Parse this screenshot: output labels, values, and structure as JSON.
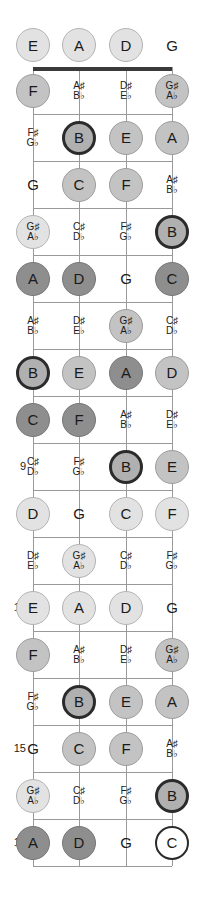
{
  "diagram": {
    "tuning": [
      "E",
      "A",
      "D",
      "G"
    ],
    "string_count": 4,
    "fret_count": 17,
    "fret_markers": [
      "5",
      "7",
      "9",
      "12",
      "15",
      "17"
    ],
    "colors": {
      "nut": "#3a3a3a",
      "fret_line": "#999999",
      "string": "#9a9a9a",
      "text": "#1a1a1a",
      "root_fill": "#ffffff",
      "root_border": "#2b2b2b",
      "accent_dark": "#5a5a5a",
      "accent_light": "#dcdcdc"
    },
    "geometry": {
      "left": 33,
      "right": 172,
      "nut_y": 67,
      "fret_spacing": 47,
      "string_x": [
        33,
        79,
        126,
        172
      ]
    }
  },
  "rows": [
    {
      "fret": "0",
      "marker": "",
      "notes": [
        {
          "name": "E",
          "alt": "",
          "style": "light",
          "shape": "circle"
        },
        {
          "name": "A",
          "alt": "",
          "style": "light",
          "shape": "circle"
        },
        {
          "name": "D",
          "alt": "",
          "style": "light",
          "shape": "circle"
        },
        {
          "name": "G",
          "alt": "",
          "style": "none",
          "shape": "plain"
        }
      ]
    },
    {
      "fret": "1",
      "marker": "",
      "notes": [
        {
          "name": "F",
          "alt": "",
          "style": "mid",
          "shape": "circle"
        },
        {
          "name": "A♯",
          "alt": "B♭",
          "style": "none",
          "shape": "plain"
        },
        {
          "name": "D♯",
          "alt": "E♭",
          "style": "none",
          "shape": "plain"
        },
        {
          "name": "G♯",
          "alt": "A♭",
          "style": "mid",
          "shape": "circle"
        }
      ]
    },
    {
      "fret": "2",
      "marker": "",
      "notes": [
        {
          "name": "F♯",
          "alt": "G♭",
          "style": "none",
          "shape": "plain"
        },
        {
          "name": "B",
          "alt": "",
          "style": "ring",
          "shape": "circle"
        },
        {
          "name": "E",
          "alt": "",
          "style": "mid",
          "shape": "circle"
        },
        {
          "name": "A",
          "alt": "",
          "style": "mid",
          "shape": "circle"
        }
      ]
    },
    {
      "fret": "3",
      "marker": "",
      "notes": [
        {
          "name": "G",
          "alt": "",
          "style": "none",
          "shape": "plain"
        },
        {
          "name": "C",
          "alt": "",
          "style": "mid",
          "shape": "circle"
        },
        {
          "name": "F",
          "alt": "",
          "style": "mid",
          "shape": "circle"
        },
        {
          "name": "A♯",
          "alt": "B♭",
          "style": "none",
          "shape": "plain"
        }
      ]
    },
    {
      "fret": "4",
      "marker": "",
      "notes": [
        {
          "name": "G♯",
          "alt": "A♭",
          "style": "light",
          "shape": "circle"
        },
        {
          "name": "C♯",
          "alt": "D♭",
          "style": "none",
          "shape": "plain"
        },
        {
          "name": "F♯",
          "alt": "G♭",
          "style": "none",
          "shape": "plain"
        },
        {
          "name": "B",
          "alt": "",
          "style": "ring",
          "shape": "circle"
        }
      ]
    },
    {
      "fret": "5",
      "marker": "5",
      "notes": [
        {
          "name": "A",
          "alt": "",
          "style": "dark",
          "shape": "circle"
        },
        {
          "name": "D",
          "alt": "",
          "style": "dark",
          "shape": "circle"
        },
        {
          "name": "G",
          "alt": "",
          "style": "none",
          "shape": "plain"
        },
        {
          "name": "C",
          "alt": "",
          "style": "dark",
          "shape": "circle"
        }
      ]
    },
    {
      "fret": "6",
      "marker": "",
      "notes": [
        {
          "name": "A♯",
          "alt": "B♭",
          "style": "none",
          "shape": "plain"
        },
        {
          "name": "D♯",
          "alt": "E♭",
          "style": "none",
          "shape": "plain"
        },
        {
          "name": "G♯",
          "alt": "A♭",
          "style": "mid",
          "shape": "circle"
        },
        {
          "name": "C♯",
          "alt": "D♭",
          "style": "none",
          "shape": "plain"
        }
      ]
    },
    {
      "fret": "7",
      "marker": "7",
      "notes": [
        {
          "name": "B",
          "alt": "",
          "style": "ring",
          "shape": "circle"
        },
        {
          "name": "E",
          "alt": "",
          "style": "mid",
          "shape": "circle"
        },
        {
          "name": "A",
          "alt": "",
          "style": "dark",
          "shape": "circle"
        },
        {
          "name": "D",
          "alt": "",
          "style": "mid",
          "shape": "circle"
        }
      ]
    },
    {
      "fret": "8",
      "marker": "",
      "notes": [
        {
          "name": "C",
          "alt": "",
          "style": "dark",
          "shape": "circle"
        },
        {
          "name": "F",
          "alt": "",
          "style": "dark",
          "shape": "circle"
        },
        {
          "name": "A♯",
          "alt": "B♭",
          "style": "none",
          "shape": "plain"
        },
        {
          "name": "D♯",
          "alt": "E♭",
          "style": "none",
          "shape": "plain"
        }
      ]
    },
    {
      "fret": "9",
      "marker": "9",
      "notes": [
        {
          "name": "C♯",
          "alt": "D♭",
          "style": "none",
          "shape": "plain"
        },
        {
          "name": "F♯",
          "alt": "G♭",
          "style": "none",
          "shape": "plain"
        },
        {
          "name": "B",
          "alt": "",
          "style": "ring",
          "shape": "circle"
        },
        {
          "name": "E",
          "alt": "",
          "style": "mid",
          "shape": "circle"
        }
      ]
    },
    {
      "fret": "10",
      "marker": "",
      "notes": [
        {
          "name": "D",
          "alt": "",
          "style": "light",
          "shape": "circle"
        },
        {
          "name": "G",
          "alt": "",
          "style": "none",
          "shape": "plain"
        },
        {
          "name": "C",
          "alt": "",
          "style": "light",
          "shape": "circle"
        },
        {
          "name": "F",
          "alt": "",
          "style": "light",
          "shape": "circle"
        }
      ]
    },
    {
      "fret": "11",
      "marker": "",
      "notes": [
        {
          "name": "D♯",
          "alt": "E♭",
          "style": "none",
          "shape": "plain"
        },
        {
          "name": "G♯",
          "alt": "A♭",
          "style": "light",
          "shape": "circle"
        },
        {
          "name": "C♯",
          "alt": "D♭",
          "style": "none",
          "shape": "plain"
        },
        {
          "name": "F♯",
          "alt": "G♭",
          "style": "none",
          "shape": "plain"
        }
      ]
    },
    {
      "fret": "12",
      "marker": "12",
      "notes": [
        {
          "name": "E",
          "alt": "",
          "style": "light",
          "shape": "circle"
        },
        {
          "name": "A",
          "alt": "",
          "style": "light",
          "shape": "circle"
        },
        {
          "name": "D",
          "alt": "",
          "style": "light",
          "shape": "circle"
        },
        {
          "name": "G",
          "alt": "",
          "style": "none",
          "shape": "plain"
        }
      ]
    },
    {
      "fret": "13",
      "marker": "",
      "notes": [
        {
          "name": "F",
          "alt": "",
          "style": "mid",
          "shape": "circle"
        },
        {
          "name": "A♯",
          "alt": "B♭",
          "style": "none",
          "shape": "plain"
        },
        {
          "name": "D♯",
          "alt": "E♭",
          "style": "none",
          "shape": "plain"
        },
        {
          "name": "G♯",
          "alt": "A♭",
          "style": "mid",
          "shape": "circle"
        }
      ]
    },
    {
      "fret": "14",
      "marker": "",
      "notes": [
        {
          "name": "F♯",
          "alt": "G♭",
          "style": "none",
          "shape": "plain"
        },
        {
          "name": "B",
          "alt": "",
          "style": "ring",
          "shape": "circle"
        },
        {
          "name": "E",
          "alt": "",
          "style": "mid",
          "shape": "circle"
        },
        {
          "name": "A",
          "alt": "",
          "style": "mid",
          "shape": "circle"
        }
      ]
    },
    {
      "fret": "15",
      "marker": "15",
      "notes": [
        {
          "name": "G",
          "alt": "",
          "style": "none",
          "shape": "plain"
        },
        {
          "name": "C",
          "alt": "",
          "style": "mid",
          "shape": "circle"
        },
        {
          "name": "F",
          "alt": "",
          "style": "mid",
          "shape": "circle"
        },
        {
          "name": "A♯",
          "alt": "B♭",
          "style": "none",
          "shape": "plain"
        }
      ]
    },
    {
      "fret": "16",
      "marker": "",
      "notes": [
        {
          "name": "G♯",
          "alt": "A♭",
          "style": "light",
          "shape": "circle"
        },
        {
          "name": "C♯",
          "alt": "D♭",
          "style": "none",
          "shape": "plain"
        },
        {
          "name": "F♯",
          "alt": "G♭",
          "style": "none",
          "shape": "plain"
        },
        {
          "name": "B",
          "alt": "",
          "style": "ring",
          "shape": "circle"
        }
      ]
    },
    {
      "fret": "17",
      "marker": "17",
      "notes": [
        {
          "name": "A",
          "alt": "",
          "style": "dark",
          "shape": "circle"
        },
        {
          "name": "D",
          "alt": "",
          "style": "dark",
          "shape": "circle"
        },
        {
          "name": "G",
          "alt": "",
          "style": "none",
          "shape": "plain"
        },
        {
          "name": "C",
          "alt": "",
          "style": "root",
          "shape": "circle"
        }
      ]
    }
  ]
}
